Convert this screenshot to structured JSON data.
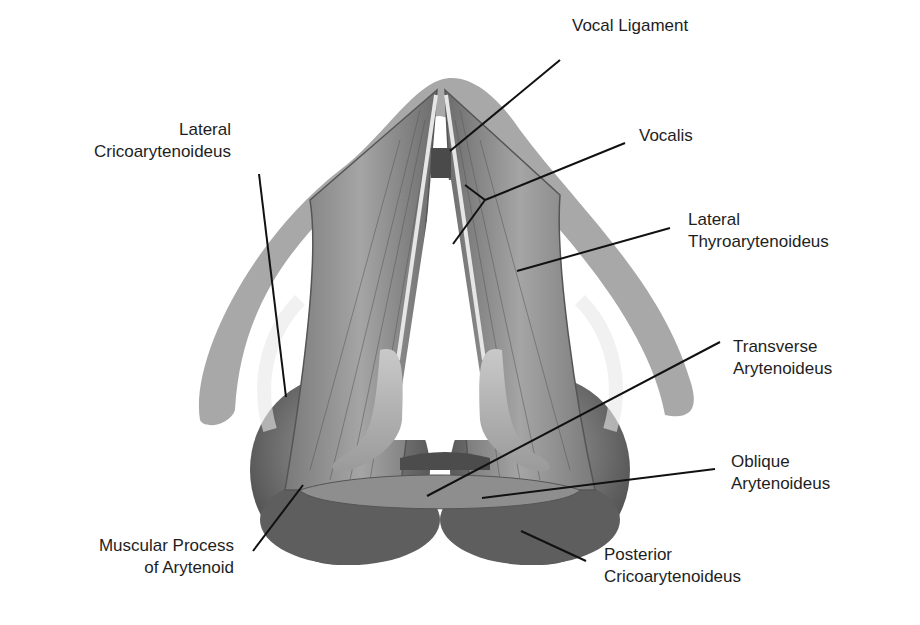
{
  "figure": {
    "colors": {
      "cartilage": "#a8a8a8",
      "muscle_light": "#9a9a9a",
      "muscle_dark": "#5a5a5a",
      "leader_line": "#111111",
      "text": "#1e1e1e"
    }
  },
  "labels": {
    "vocal_ligament": {
      "line1": "Vocal Ligament"
    },
    "vocalis": {
      "line1": "Vocalis"
    },
    "lateral_thyroarytenoideus": {
      "line1": "Lateral",
      "line2": "Thyroarytenoideus"
    },
    "lateral_cricoarytenoideus": {
      "line1": "Lateral",
      "line2": "Cricoarytenoideus"
    },
    "transverse_arytenoideus": {
      "line1": "Transverse",
      "line2": "Arytenoideus"
    },
    "oblique_arytenoideus": {
      "line1": "Oblique",
      "line2": "Arytenoideus"
    },
    "muscular_process": {
      "line1": "Muscular Process",
      "line2": "of Arytenoid"
    },
    "posterior_cricoarytenoideus": {
      "line1": "Posterior",
      "line2": "Cricoarytenoideus"
    }
  }
}
